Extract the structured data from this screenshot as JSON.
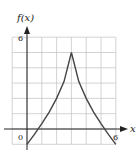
{
  "chart_data": {
    "type": "line",
    "title": "",
    "xlabel": "x",
    "ylabel": "f(x)",
    "xlim": [
      -1,
      6
    ],
    "ylim": [
      -1,
      6
    ],
    "grid": true,
    "x_tick_labels": [
      "0",
      "6"
    ],
    "y_tick_labels": [
      "6"
    ],
    "series": [
      {
        "name": "f(x)",
        "x": [
          0,
          0.5,
          1,
          1.5,
          2,
          2.5,
          3,
          3.5,
          4,
          4.5,
          5,
          5.5,
          6
        ],
        "values": [
          -1,
          -0.35,
          0.35,
          1.1,
          2.0,
          3.1,
          5.0,
          3.1,
          2.0,
          1.1,
          0.35,
          -0.35,
          -1
        ]
      }
    ]
  },
  "labels": {
    "y_axis": "f(x)",
    "x_axis": "x",
    "origin": "0",
    "x_max": "6",
    "y_max": "6"
  }
}
